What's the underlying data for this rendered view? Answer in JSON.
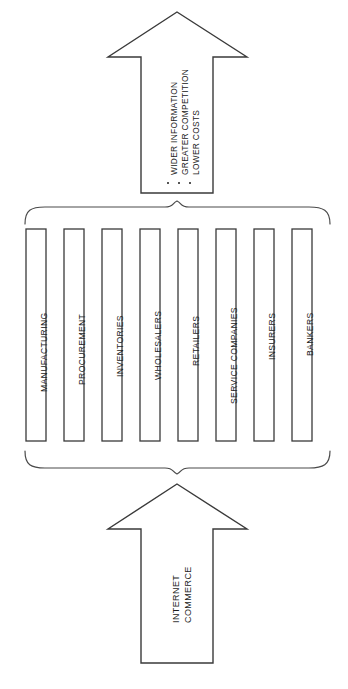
{
  "diagram": {
    "orientation": "rotated-90-ccw",
    "colors": {
      "background": "#ffffff",
      "stroke": "#3a3a3a",
      "brace_stroke": "#4a4a4a",
      "text": "#1d1d1d"
    },
    "input_arrow": {
      "name": "internet-commerce-arrow",
      "caption_lines": [
        "INTERNET",
        "COMMERCE"
      ]
    },
    "sectors": {
      "name": "sector-bars",
      "bars": [
        {
          "label": "MANUFACTURING"
        },
        {
          "label": "PROCUREMENT"
        },
        {
          "label": "INVENTORIES"
        },
        {
          "label": "WHOLESALERS"
        },
        {
          "label": "RETAILERS"
        },
        {
          "label": "SERVICE COMPANIES"
        },
        {
          "label": "INSURERS"
        },
        {
          "label": "BANKERS"
        }
      ]
    },
    "output_arrow": {
      "name": "outcomes-arrow",
      "bullets": [
        {
          "label": "WIDER INFORMATION"
        },
        {
          "label": "GREATER COMPETITION"
        },
        {
          "label": "LOWER COSTS"
        }
      ]
    }
  }
}
